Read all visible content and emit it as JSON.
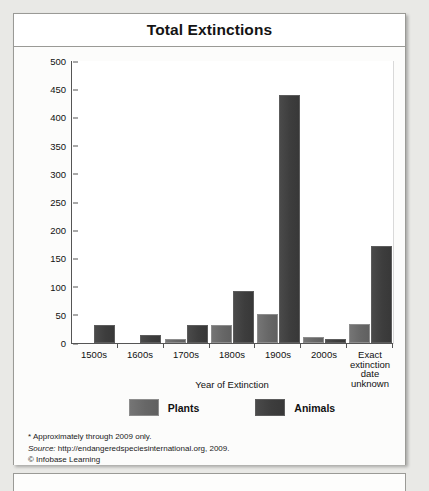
{
  "figure": {
    "title": "Total Extinctions"
  },
  "notes": {
    "footnote": "* Approximately through 2009 only.",
    "source_label": "Source:",
    "source_value": " http://endangeredspeciesinternational.org, 2009.",
    "copyright": "© Infobase Learning"
  },
  "chart_data": {
    "type": "bar",
    "title": "Total Extinctions",
    "xlabel": "Year of Extinction",
    "ylabel": "Number of Extinctions",
    "ylim": [
      0,
      500
    ],
    "yticks": [
      500,
      450,
      400,
      350,
      300,
      250,
      200,
      150,
      100,
      50,
      0
    ],
    "grid": false,
    "legend_position": "bottom",
    "categories": [
      "1500s",
      "1600s",
      "1700s",
      "1800s",
      "1900s",
      "2000s",
      "Exact extinction date unknown"
    ],
    "category_lines": [
      [
        "1500s"
      ],
      [
        "1600s"
      ],
      [
        "1700s"
      ],
      [
        "1800s"
      ],
      [
        "1900s"
      ],
      [
        "2000s"
      ],
      [
        "Exact",
        "extinction",
        "date unknown"
      ]
    ],
    "series": [
      {
        "name": "Plants",
        "color": "#676767",
        "values": [
          0,
          0,
          3,
          28,
          48,
          8,
          30
        ]
      },
      {
        "name": "Animals",
        "color": "#3d3d3d",
        "values": [
          28,
          10,
          28,
          89,
          437,
          4,
          168
        ]
      }
    ]
  }
}
